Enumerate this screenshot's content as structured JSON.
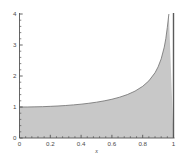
{
  "chart_data": {
    "type": "area",
    "title": "",
    "subtitle": "",
    "xlabel": "x",
    "ylabel": "",
    "xlim": [
      0,
      1
    ],
    "ylim": [
      0,
      4
    ],
    "grid": false,
    "legend": null,
    "fill_color": "#c8c8c8",
    "line_color": "#6e6e6e",
    "axis_color": "#555555",
    "background_color": "#ffffff",
    "asymptote": {
      "x": 1,
      "label": "",
      "color": "#5a5a5a"
    },
    "function_note": "1/sqrt(1-x^2)",
    "xticks": [
      0,
      0.2,
      0.4,
      0.6,
      0.8,
      1
    ],
    "xticklabels": [
      "0",
      "0.2",
      "0.4",
      "0.6",
      "0.8",
      "1"
    ],
    "yticks": [
      0,
      1,
      2,
      3,
      4
    ],
    "yticklabels": [
      "0",
      "1",
      "2",
      "3",
      "4"
    ],
    "minor_ticks_per_major": 4,
    "x": [
      0,
      0.05,
      0.1,
      0.15,
      0.2,
      0.25,
      0.3,
      0.35,
      0.4,
      0.45,
      0.5,
      0.55,
      0.6,
      0.65,
      0.7,
      0.75,
      0.8,
      0.84,
      0.88,
      0.9,
      0.92,
      0.94,
      0.95,
      0.96,
      0.97,
      0.975,
      0.98,
      0.985,
      0.99,
      0.993,
      0.995,
      0.997
    ],
    "values": [
      1.0,
      1.001,
      1.005,
      1.011,
      1.021,
      1.033,
      1.048,
      1.068,
      1.091,
      1.12,
      1.155,
      1.198,
      1.25,
      1.316,
      1.4,
      1.512,
      1.667,
      1.843,
      2.105,
      2.294,
      2.552,
      2.931,
      3.203,
      3.571,
      4.113,
      4.494,
      5.025,
      5.804,
      7.089,
      8.205,
      10.013,
      12.925
    ]
  }
}
